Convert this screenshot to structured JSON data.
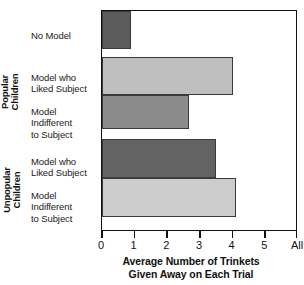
{
  "chart_data": {
    "type": "bar",
    "orientation": "horizontal",
    "title": "",
    "xlabel": "Average Number of Trinkets Given Away on Each Trial",
    "ylabel": "",
    "xlim": [
      0,
      6
    ],
    "xticks": [
      0,
      1,
      2,
      3,
      4,
      5,
      6
    ],
    "xticklabels": [
      "0",
      "1",
      "2",
      "3",
      "4",
      "5",
      "All"
    ],
    "grid": false,
    "legend": "none",
    "groups": [
      {
        "name": "",
        "categories": [
          "No Model"
        ],
        "values": [
          0.9
        ]
      },
      {
        "name": "Popular Children",
        "categories": [
          "Model who Liked Subject",
          "Model Indifferent to Subject"
        ],
        "values": [
          4.0,
          2.65
        ]
      },
      {
        "name": "Unpopular Children",
        "categories": [
          "Model who Liked Subject",
          "Model Indifferent to Subject"
        ],
        "values": [
          3.5,
          4.1
        ]
      }
    ],
    "categories": [
      "No Model",
      "Model who Liked Subject",
      "Model Indifferent to Subject",
      "Model who Liked Subject",
      "Model Indifferent to Subject"
    ],
    "values": [
      0.9,
      4.0,
      2.65,
      3.5,
      4.1
    ],
    "bar_colors": [
      "#5c5c5c",
      "#bfbfbf",
      "#8b8b8b",
      "#636363",
      "#cccccc"
    ]
  },
  "axis": {
    "title_line1": "Average Number of Trinkets",
    "title_line2": "Given Away on Each Trial",
    "ticks": [
      {
        "label": "0",
        "value": 0
      },
      {
        "label": "1",
        "value": 1
      },
      {
        "label": "2",
        "value": 2
      },
      {
        "label": "3",
        "value": 3
      },
      {
        "label": "4",
        "value": 4
      },
      {
        "label": "5",
        "value": 5
      },
      {
        "label": "All",
        "value": 6
      }
    ]
  },
  "groups": {
    "popular": "Popular\nChildren",
    "unpopular": "Unpopular\nChildren"
  },
  "categories": [
    {
      "label": "No Model"
    },
    {
      "label": "Model who\nLiked Subject"
    },
    {
      "label": "Model\nIndifferent\nto Subject"
    },
    {
      "label": "Model who\nLiked Subject"
    },
    {
      "label": "Model\nIndifferent\nto Subject"
    }
  ],
  "bars": [
    {
      "name": "no-model",
      "value": 0.9,
      "color": "#5c5c5c",
      "top": 10,
      "height": 38
    },
    {
      "name": "popular-liked",
      "value": 4.0,
      "color": "#bfbfbf",
      "top": 56,
      "height": 38
    },
    {
      "name": "popular-indifferent",
      "value": 2.65,
      "color": "#8b8b8b",
      "top": 94,
      "height": 34
    },
    {
      "name": "unpopular-liked",
      "value": 3.5,
      "color": "#636363",
      "top": 138,
      "height": 39
    },
    {
      "name": "unpopular-indifferent",
      "value": 4.1,
      "color": "#cccccc",
      "top": 177,
      "height": 39
    }
  ]
}
